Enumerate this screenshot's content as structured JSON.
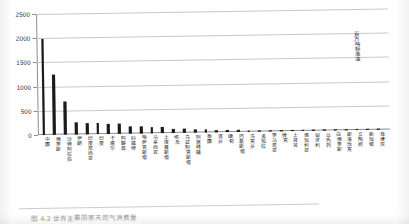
{
  "figure": {
    "unit_label": "百万吨标准油",
    "caption": "图 4-2  世界主要国家天然气消费量"
  },
  "chart_data": {
    "type": "bar",
    "title": "",
    "subtitle": "",
    "xlabel": "",
    "ylabel": "百万吨标准油",
    "ylim": [
      0,
      2500
    ],
    "yticks": [
      0,
      500,
      1000,
      1500,
      2000,
      2500
    ],
    "ytick_labels": [
      "0",
      "500",
      "1000",
      "1500",
      "2000",
      "2500"
    ],
    "grid": true,
    "legend": null,
    "bar_color": "#1b1b1b",
    "categories": [
      "中国",
      "俄罗斯",
      "沙特阿拉伯",
      "伊朗",
      "印度尼西亚",
      "印度",
      "卡塔尔",
      "阿联酋",
      "科威特",
      "哈萨克斯坦",
      "马来西亚",
      "土库曼斯坦",
      "埃及",
      "乌兹别克斯坦",
      "阿塞拜疆",
      "泰国",
      "波兰",
      "缅甸",
      "巴基斯坦",
      "乌克兰",
      "孟加拉",
      "罗马尼亚",
      "捷克",
      "土耳其",
      "保加利亚",
      "匈牙利",
      "以色列",
      "白俄罗斯",
      "斯洛伐克",
      "立陶宛",
      "新加坡",
      "菲律宾"
    ],
    "values": [
      1985,
      1250,
      680,
      250,
      235,
      225,
      215,
      205,
      150,
      135,
      125,
      115,
      92,
      80,
      60,
      52,
      46,
      40,
      34,
      30,
      26,
      22,
      19,
      16,
      14,
      12,
      10,
      9,
      8,
      7,
      6,
      5
    ]
  }
}
